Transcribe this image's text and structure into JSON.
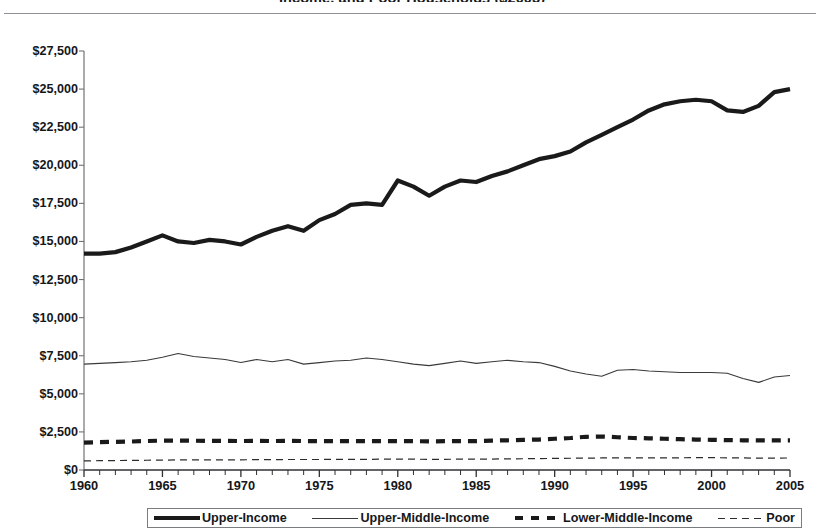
{
  "figure": {
    "title": "Income, and Poor Households ($2005)",
    "title_visible_note": "cropped at top edge"
  },
  "chart_data": {
    "type": "line",
    "title": "Income, and Poor Households ($2005)",
    "xlabel": "",
    "ylabel": "",
    "xlim": [
      1960,
      2005
    ],
    "ylim": [
      0,
      27500
    ],
    "ytick_values": [
      0,
      2500,
      5000,
      7500,
      10000,
      12500,
      15000,
      17500,
      20000,
      22500,
      25000,
      27500
    ],
    "ytick_labels": [
      "$0",
      "$2,500",
      "$5,000",
      "$7,500",
      "$10,000",
      "$12,500",
      "$15,000",
      "$17,500",
      "$20,000",
      "$22,500",
      "$25,000",
      "$27,500"
    ],
    "xtick_labels": [
      "1960",
      "1965",
      "1970",
      "1975",
      "1980",
      "1985",
      "1990",
      "1995",
      "2000",
      "2005"
    ],
    "xtick_values": [
      1960,
      1965,
      1970,
      1975,
      1980,
      1985,
      1990,
      1995,
      2000,
      2005
    ],
    "minor_xticks_every": 1,
    "grid": false,
    "legend_position": "bottom",
    "x": [
      1960,
      1961,
      1962,
      1963,
      1964,
      1965,
      1966,
      1967,
      1968,
      1969,
      1970,
      1971,
      1972,
      1973,
      1974,
      1975,
      1976,
      1977,
      1978,
      1979,
      1980,
      1981,
      1982,
      1983,
      1984,
      1985,
      1986,
      1987,
      1988,
      1989,
      1990,
      1991,
      1992,
      1993,
      1994,
      1995,
      1996,
      1997,
      1998,
      1999,
      2000,
      2001,
      2002,
      2003,
      2004,
      2005
    ],
    "series": [
      {
        "name": "Upper-Income",
        "style": "thick-solid",
        "color": "#1a1a1a",
        "values": [
          14200,
          14200,
          14300,
          14600,
          15000,
          15400,
          15000,
          14900,
          15100,
          15000,
          14800,
          15300,
          15700,
          16000,
          15700,
          16400,
          16800,
          17400,
          17500,
          17400,
          19000,
          18600,
          18000,
          18600,
          19000,
          18900,
          19300,
          19600,
          20000,
          20400,
          20600,
          20900,
          21500,
          22000,
          22500,
          23000,
          23600,
          24000,
          24200,
          24300,
          24200,
          23600,
          23500,
          23900,
          24800,
          25000
        ]
      },
      {
        "name": "Upper-Middle-Income",
        "style": "thin-solid",
        "color": "#3a3a3a",
        "values": [
          6950,
          7000,
          7050,
          7100,
          7200,
          7400,
          7650,
          7450,
          7350,
          7250,
          7050,
          7250,
          7100,
          7250,
          6950,
          7050,
          7150,
          7200,
          7350,
          7250,
          7100,
          6950,
          6850,
          7000,
          7150,
          7000,
          7100,
          7200,
          7100,
          7050,
          6800,
          6500,
          6300,
          6150,
          6550,
          6600,
          6500,
          6450,
          6400,
          6400,
          6400,
          6350,
          6000,
          5750,
          6100,
          6200
        ]
      },
      {
        "name": "Lower-Middle-Income",
        "style": "thick-dashed",
        "color": "#1a1a1a",
        "values": [
          1800,
          1830,
          1850,
          1870,
          1900,
          1930,
          1930,
          1920,
          1910,
          1910,
          1900,
          1910,
          1900,
          1920,
          1900,
          1900,
          1900,
          1900,
          1900,
          1900,
          1890,
          1890,
          1880,
          1890,
          1900,
          1900,
          1930,
          1950,
          1980,
          2000,
          2050,
          2100,
          2180,
          2200,
          2150,
          2100,
          2080,
          2050,
          2020,
          2000,
          1980,
          1960,
          1950,
          1940,
          1940,
          1950
        ]
      },
      {
        "name": "Poor",
        "style": "thin-dashed",
        "color": "#2c2c2c",
        "values": [
          600,
          610,
          620,
          630,
          640,
          650,
          660,
          660,
          660,
          670,
          670,
          680,
          680,
          690,
          690,
          690,
          700,
          700,
          700,
          710,
          710,
          710,
          700,
          700,
          710,
          720,
          720,
          730,
          740,
          750,
          760,
          770,
          780,
          790,
          790,
          800,
          800,
          800,
          800,
          810,
          810,
          800,
          790,
          780,
          780,
          790
        ]
      }
    ]
  },
  "legend": {
    "items": [
      {
        "label": "Upper-Income",
        "swatch": "thick-solid-swatch"
      },
      {
        "label": "Upper-Middle-Income",
        "swatch": "thin-solid-swatch"
      },
      {
        "label": "Lower-Middle-Income",
        "swatch": "thick-dashed-swatch"
      },
      {
        "label": "Poor",
        "swatch": "thin-dashed-swatch"
      }
    ]
  },
  "axes": {
    "y_labels": [
      "$27,500",
      "$25,000",
      "$22,500",
      "$20,000",
      "$17,500",
      "$15,000",
      "$12,500",
      "$10,000",
      "$7,500",
      "$5,000",
      "$2,500",
      "$0"
    ],
    "x_labels": [
      "1960",
      "1965",
      "1970",
      "1975",
      "1980",
      "1985",
      "1990",
      "1995",
      "2000",
      "2005"
    ]
  }
}
